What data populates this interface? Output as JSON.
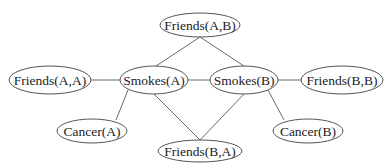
{
  "diagram": {
    "type": "undirected-graph",
    "nodes": [
      {
        "id": "friends_ab",
        "label": "Friends(A,B)",
        "cx": 200,
        "cy": 25,
        "rx": 40,
        "ry": 12
      },
      {
        "id": "friends_aa",
        "label": "Friends(A,A)",
        "cx": 50,
        "cy": 80,
        "rx": 41,
        "ry": 14
      },
      {
        "id": "smokes_a",
        "label": "Smokes(A)",
        "cx": 154,
        "cy": 80,
        "rx": 34,
        "ry": 14
      },
      {
        "id": "smokes_b",
        "label": "Smokes(B)",
        "cx": 244,
        "cy": 80,
        "rx": 34,
        "ry": 14
      },
      {
        "id": "friends_bb",
        "label": "Friends(B,B)",
        "cx": 342,
        "cy": 80,
        "rx": 41,
        "ry": 14
      },
      {
        "id": "cancer_a",
        "label": "Cancer(A)",
        "cx": 92,
        "cy": 131,
        "rx": 35,
        "ry": 12
      },
      {
        "id": "friends_ba",
        "label": "Friends(B,A)",
        "cx": 200,
        "cy": 151,
        "rx": 42,
        "ry": 11
      },
      {
        "id": "cancer_b",
        "label": "Cancer(B)",
        "cx": 308,
        "cy": 131,
        "rx": 35,
        "ry": 12
      }
    ],
    "edges": [
      {
        "from": "friends_ab",
        "to": "smokes_a"
      },
      {
        "from": "friends_ab",
        "to": "smokes_b"
      },
      {
        "from": "friends_aa",
        "to": "smokes_a"
      },
      {
        "from": "smokes_a",
        "to": "smokes_b"
      },
      {
        "from": "smokes_b",
        "to": "friends_bb"
      },
      {
        "from": "smokes_a",
        "to": "cancer_a"
      },
      {
        "from": "smokes_a",
        "to": "friends_ba"
      },
      {
        "from": "smokes_b",
        "to": "friends_ba"
      },
      {
        "from": "smokes_b",
        "to": "cancer_b"
      }
    ]
  }
}
